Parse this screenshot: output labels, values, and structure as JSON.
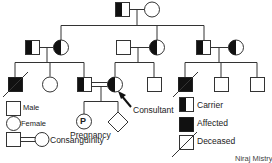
{
  "legend": {
    "male": "Male",
    "female": "Female",
    "consanguinity": "Consanguinity",
    "carrier": "Carrier",
    "affected": "Affected",
    "deceased": "Deceased"
  },
  "labels": {
    "pregnancy": "Pregnancy",
    "pregnancy_symbol": "P",
    "consultant": "Consultant"
  },
  "credit": "Niraj Mistry",
  "colors": {
    "line": "#333333",
    "fill": "#111111",
    "background": "#ffffff"
  }
}
